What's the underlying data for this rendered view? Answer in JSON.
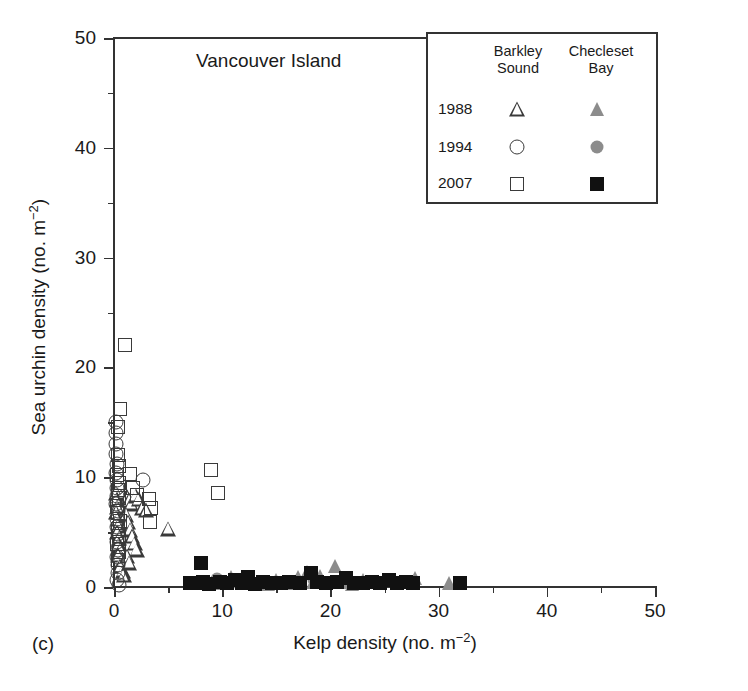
{
  "panel": {
    "label": "(c)",
    "title": "Vancouver Island"
  },
  "legend": {
    "columns": [
      {
        "name": "barkley",
        "line1": "Barkley",
        "line2": "Sound"
      },
      {
        "name": "checleset",
        "line1": "Checleset",
        "line2": "Bay"
      }
    ],
    "rows": [
      {
        "year": "1988",
        "barkley_symbol": "triangle-open",
        "checleset_symbol": "triangle-filled-gray"
      },
      {
        "year": "1994",
        "barkley_symbol": "circle-open",
        "checleset_symbol": "circle-filled-gray"
      },
      {
        "year": "2007",
        "barkley_symbol": "square-open",
        "checleset_symbol": "square-filled-black"
      }
    ]
  },
  "colors": {
    "axis": "#333333",
    "open_marker_edge": "#3a3a3a",
    "gray_fill": "#8c8c8c",
    "black_fill": "#111111",
    "background": "#ffffff"
  },
  "chart_data": {
    "type": "scatter",
    "title": "Vancouver Island",
    "xlabel": "Kelp density (no. m¯²)",
    "ylabel": "Sea urchin density (no. m¯²)",
    "xlim": [
      0,
      50
    ],
    "ylim": [
      0,
      50
    ],
    "xticks": [
      0,
      10,
      20,
      30,
      40,
      50
    ],
    "yticks": [
      0,
      10,
      20,
      30,
      40,
      50
    ],
    "xminorticks": [
      5,
      15,
      25,
      35,
      45
    ],
    "yminorticks": [
      5,
      15,
      25,
      35,
      45
    ],
    "grid": false,
    "legend_position": "top-right",
    "series": [
      {
        "name": "Barkley Sound 1988",
        "marker": "triangle-open",
        "points": [
          [
            0.2,
            8.6
          ],
          [
            0.25,
            8.0
          ],
          [
            0.3,
            7.3
          ],
          [
            0.2,
            6.8
          ],
          [
            0.35,
            6.2
          ],
          [
            0.4,
            5.6
          ],
          [
            0.3,
            5.0
          ],
          [
            0.5,
            4.5
          ],
          [
            0.45,
            3.9
          ],
          [
            0.6,
            3.4
          ],
          [
            0.4,
            2.9
          ],
          [
            0.7,
            2.4
          ],
          [
            0.55,
            1.9
          ],
          [
            0.8,
            1.5
          ],
          [
            0.9,
            1.1
          ],
          [
            1.0,
            8.6
          ],
          [
            1.2,
            8.2
          ],
          [
            1.4,
            7.9
          ],
          [
            1.6,
            7.6
          ],
          [
            2.0,
            8.3
          ],
          [
            2.3,
            8.0
          ],
          [
            1.1,
            6.6
          ],
          [
            1.3,
            5.9
          ],
          [
            1.5,
            5.2
          ],
          [
            1.7,
            4.6
          ],
          [
            1.9,
            4.0
          ],
          [
            2.1,
            3.4
          ],
          [
            1.2,
            2.8
          ],
          [
            1.4,
            2.2
          ],
          [
            2.6,
            7.2
          ],
          [
            3.0,
            7.0
          ],
          [
            5.0,
            5.3
          ]
        ]
      },
      {
        "name": "Barkley Sound 1994",
        "marker": "circle-open",
        "points": [
          [
            0.15,
            15.0
          ],
          [
            0.2,
            14.0
          ],
          [
            0.15,
            13.0
          ],
          [
            0.2,
            12.1
          ],
          [
            0.25,
            11.2
          ],
          [
            0.2,
            10.4
          ],
          [
            0.3,
            9.7
          ],
          [
            0.25,
            9.0
          ],
          [
            0.3,
            8.3
          ],
          [
            0.2,
            7.6
          ],
          [
            0.35,
            6.9
          ],
          [
            0.3,
            6.2
          ],
          [
            0.25,
            5.5
          ],
          [
            0.4,
            4.8
          ],
          [
            0.3,
            4.1
          ],
          [
            0.35,
            3.4
          ],
          [
            0.3,
            2.7
          ],
          [
            0.4,
            2.0
          ],
          [
            0.35,
            1.3
          ],
          [
            0.3,
            0.6
          ],
          [
            0.45,
            0.2
          ],
          [
            2.7,
            9.7
          ]
        ]
      },
      {
        "name": "Barkley Sound 2007",
        "marker": "square-open",
        "points": [
          [
            1.0,
            22.0
          ],
          [
            0.6,
            16.2
          ],
          [
            0.4,
            14.6
          ],
          [
            0.35,
            12.0
          ],
          [
            0.5,
            11.0
          ],
          [
            0.3,
            10.2
          ],
          [
            0.45,
            9.5
          ],
          [
            0.35,
            8.8
          ],
          [
            0.5,
            8.1
          ],
          [
            0.3,
            7.4
          ],
          [
            0.4,
            6.7
          ],
          [
            0.55,
            6.0
          ],
          [
            0.35,
            5.3
          ],
          [
            0.45,
            4.6
          ],
          [
            0.3,
            3.9
          ],
          [
            0.5,
            3.2
          ],
          [
            0.4,
            2.5
          ],
          [
            1.5,
            10.3
          ],
          [
            1.8,
            9.0
          ],
          [
            2.1,
            8.4
          ],
          [
            3.2,
            8.0
          ],
          [
            3.4,
            7.2
          ],
          [
            3.3,
            5.9
          ],
          [
            9.0,
            10.7
          ],
          [
            9.6,
            8.6
          ]
        ]
      },
      {
        "name": "Checleset Bay 1988",
        "marker": "triangle-filled-gray",
        "points": [
          [
            12.6,
            0.45
          ],
          [
            14.2,
            0.3
          ],
          [
            15.0,
            0.6
          ],
          [
            16.0,
            0.35
          ],
          [
            17.0,
            0.9
          ],
          [
            17.8,
            1.4
          ],
          [
            18.4,
            0.5
          ],
          [
            19.0,
            1.0
          ],
          [
            19.6,
            0.4
          ],
          [
            20.4,
            1.9
          ],
          [
            21.2,
            0.5
          ],
          [
            22.0,
            0.3
          ],
          [
            23.0,
            0.6
          ],
          [
            27.8,
            0.8
          ],
          [
            31.0,
            0.4
          ],
          [
            9.4,
            0.4
          ],
          [
            10.8,
            0.9
          ]
        ]
      },
      {
        "name": "Checleset Bay 1994",
        "marker": "circle-filled-gray",
        "points": [
          [
            9.5,
            0.7
          ],
          [
            11.0,
            0.5
          ],
          [
            13.5,
            0.4
          ],
          [
            18.5,
            0.6
          ]
        ]
      },
      {
        "name": "Checleset Bay 2007",
        "marker": "square-filled-black",
        "points": [
          [
            7.0,
            0.35
          ],
          [
            7.6,
            0.4
          ],
          [
            8.0,
            2.2
          ],
          [
            8.2,
            0.5
          ],
          [
            8.8,
            0.3
          ],
          [
            9.8,
            0.45
          ],
          [
            10.4,
            0.35
          ],
          [
            11.2,
            0.6
          ],
          [
            11.8,
            0.4
          ],
          [
            12.4,
            0.9
          ],
          [
            13.0,
            0.3
          ],
          [
            13.8,
            0.5
          ],
          [
            14.6,
            0.4
          ],
          [
            15.4,
            0.35
          ],
          [
            16.2,
            0.5
          ],
          [
            17.2,
            0.4
          ],
          [
            18.2,
            1.3
          ],
          [
            18.8,
            0.45
          ],
          [
            19.6,
            0.35
          ],
          [
            20.6,
            0.5
          ],
          [
            21.4,
            0.8
          ],
          [
            22.2,
            0.4
          ],
          [
            23.0,
            0.35
          ],
          [
            23.8,
            0.5
          ],
          [
            24.6,
            0.4
          ],
          [
            25.4,
            0.6
          ],
          [
            26.2,
            0.35
          ],
          [
            27.0,
            0.5
          ],
          [
            27.6,
            0.4
          ],
          [
            32.0,
            0.4
          ]
        ]
      }
    ]
  }
}
